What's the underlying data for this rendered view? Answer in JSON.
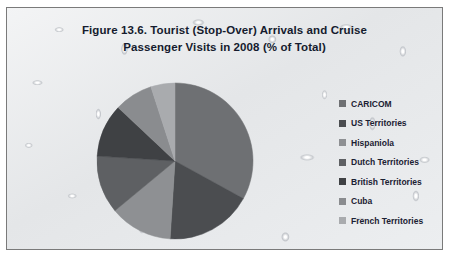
{
  "figure": {
    "title_line1": "Figure 13.6. Tourist (Stop-Over) Arrivals and Cruise",
    "title_line2": "Passenger Visits in 2008 (% of Total)",
    "border_color": "#7a7a7a",
    "background": "water-droplet-texture"
  },
  "chart_data": {
    "type": "pie",
    "title": "Figure 13.6. Tourist (Stop-Over) Arrivals and Cruise Passenger Visits in 2008 (% of Total)",
    "xlabel": "",
    "ylabel": "",
    "legend_position": "right",
    "grid": false,
    "start_angle_deg": 0,
    "direction": "clockwise",
    "categories": [
      "CARICOM",
      "US Territories",
      "Hispaniola",
      "Dutch Territories",
      "British Territories",
      "Cuba",
      "French Territories"
    ],
    "values": [
      33,
      18,
      13,
      12,
      11,
      8,
      5
    ],
    "colors": [
      "#6e7073",
      "#4b4d50",
      "#8e9093",
      "#5e6063",
      "#3f4144",
      "#8a8c8f",
      "#a9abae"
    ]
  },
  "legend": {
    "items": [
      {
        "label": "CARICOM",
        "color": "#6e7073"
      },
      {
        "label": "US Territories",
        "color": "#4b4d50"
      },
      {
        "label": "Hispaniola",
        "color": "#8e9093"
      },
      {
        "label": "Dutch Territories",
        "color": "#5e6063"
      },
      {
        "label": "British Territories",
        "color": "#3f4144"
      },
      {
        "label": "Cuba",
        "color": "#8a8c8f"
      },
      {
        "label": "French Territories",
        "color": "#a9abae"
      }
    ]
  }
}
